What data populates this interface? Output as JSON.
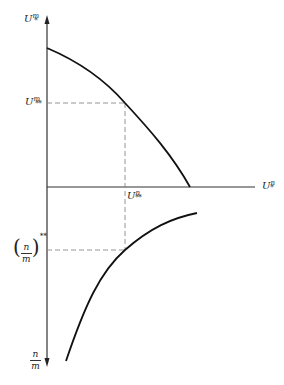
{
  "diagram": {
    "type": "two-panel economic diagram",
    "axes": {
      "vertical_top_label": {
        "base": "U",
        "sup": "m",
        "sub": "*"
      },
      "horizontal_label": {
        "base": "U",
        "sup": "n",
        "sub": "*"
      },
      "vertical_bottom_label": {
        "numerator": "n",
        "denominator": "m"
      }
    },
    "reference_labels": {
      "y_level_upper": {
        "base": "U",
        "sup": "m",
        "sub": "**"
      },
      "x_level": {
        "base": "U",
        "sup": "n",
        "sub": "**"
      },
      "y_level_lower": {
        "numerator": "n",
        "denominator": "m",
        "sup": "**"
      }
    },
    "curves": [
      {
        "name": "utility-frontier",
        "description": "downward sloping concave curve from U^m_* axis to U^n_* axis"
      },
      {
        "name": "ratio-curve",
        "description": "concave curve in lower panel relating U^n_* to n/m"
      }
    ],
    "colors": {
      "line": "#111111",
      "axis": "#333333",
      "dashed": "#888888",
      "background": "#ffffff"
    }
  }
}
